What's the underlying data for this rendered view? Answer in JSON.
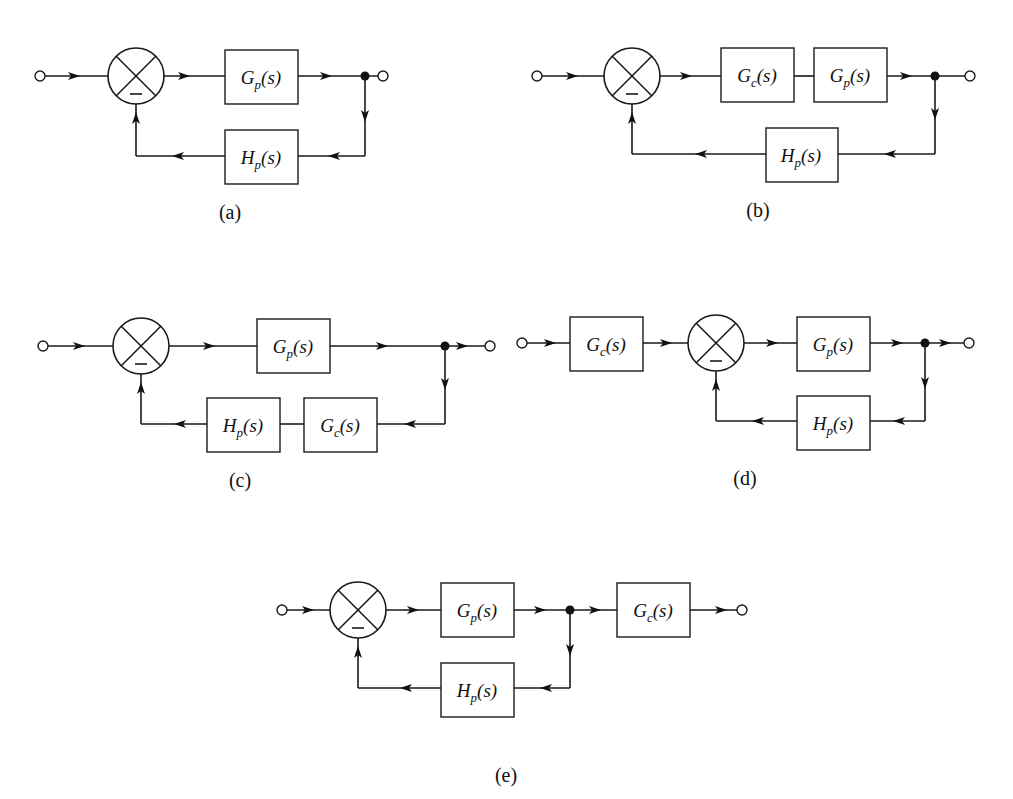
{
  "figure": {
    "diagrams": [
      {
        "id": "a",
        "caption": "(a)",
        "forward_path": [
          "G_p(s)"
        ],
        "feedback_path": [
          "H_p(s)"
        ],
        "blocks": [
          {
            "name": "G",
            "sub": "p",
            "label": "G_p(s)"
          },
          {
            "name": "H",
            "sub": "p",
            "label": "H_p(s)"
          }
        ]
      },
      {
        "id": "b",
        "caption": "(b)",
        "forward_path": [
          "G_c(s)",
          "G_p(s)"
        ],
        "feedback_path": [
          "H_p(s)"
        ],
        "blocks": [
          {
            "name": "G",
            "sub": "c",
            "label": "G_c(s)"
          },
          {
            "name": "G",
            "sub": "p",
            "label": "G_p(s)"
          },
          {
            "name": "H",
            "sub": "p",
            "label": "H_p(s)"
          }
        ]
      },
      {
        "id": "c",
        "caption": "(c)",
        "forward_path": [
          "G_p(s)"
        ],
        "feedback_path": [
          "G_c(s)",
          "H_p(s)"
        ],
        "blocks": [
          {
            "name": "G",
            "sub": "p",
            "label": "G_p(s)"
          },
          {
            "name": "H",
            "sub": "p",
            "label": "H_p(s)"
          },
          {
            "name": "G",
            "sub": "c",
            "label": "G_c(s)"
          }
        ]
      },
      {
        "id": "d",
        "caption": "(d)",
        "prefilter": [
          "G_c(s)"
        ],
        "forward_path": [
          "G_p(s)"
        ],
        "feedback_path": [
          "H_p(s)"
        ],
        "blocks": [
          {
            "name": "G",
            "sub": "c",
            "label": "G_c(s)"
          },
          {
            "name": "G",
            "sub": "p",
            "label": "G_p(s)"
          },
          {
            "name": "H",
            "sub": "p",
            "label": "H_p(s)"
          }
        ]
      },
      {
        "id": "e",
        "caption": "(e)",
        "forward_path": [
          "G_p(s)"
        ],
        "feedback_path": [
          "H_p(s)"
        ],
        "postfilter": [
          "G_c(s)"
        ],
        "blocks": [
          {
            "name": "G",
            "sub": "p",
            "label": "G_p(s)"
          },
          {
            "name": "H",
            "sub": "p",
            "label": "H_p(s)"
          },
          {
            "name": "G",
            "sub": "c",
            "label": "G_c(s)"
          }
        ]
      }
    ],
    "summing_junction_sign": "−",
    "colors": {
      "ink": "#1a1a1a",
      "background": "#ffffff"
    }
  }
}
